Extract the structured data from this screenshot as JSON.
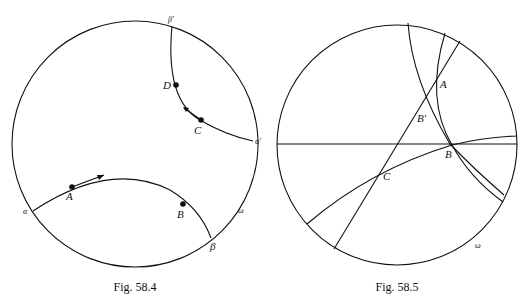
{
  "figures": [
    {
      "caption": "Fig. 58.4",
      "labels": {
        "beta_prime": "β′",
        "alpha_prime": "α′",
        "alpha": "α",
        "beta": "β",
        "omega": "ω",
        "A": "A",
        "B": "B",
        "C": "C",
        "D": "D"
      }
    },
    {
      "caption": "Fig. 58.5",
      "labels": {
        "A": "A",
        "B_prime": "B′",
        "B": "B",
        "C": "C",
        "omega": "ω"
      }
    }
  ]
}
